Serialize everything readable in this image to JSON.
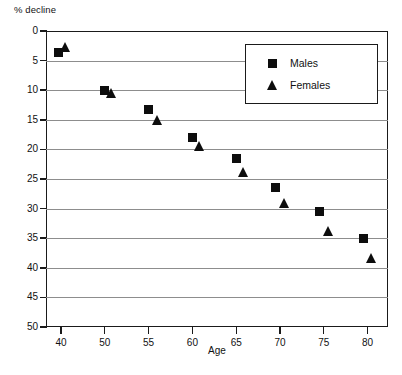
{
  "chart_data": {
    "type": "scatter",
    "title": "",
    "ylabel": "% decline",
    "xlabel": "Age",
    "ylim": [
      0,
      50
    ],
    "y_inverted": true,
    "grid": true,
    "legend_position": "top-right",
    "y_ticks": [
      "0",
      "5",
      "10",
      "15",
      "20",
      "25",
      "30",
      "35",
      "40",
      "45",
      "50"
    ],
    "x_ticks": [
      "40",
      "50",
      "55",
      "60",
      "65",
      "70",
      "75",
      "80"
    ],
    "series": [
      {
        "name": "Males",
        "marker": "square",
        "color": "#0d0d0d",
        "x": [
          39.5,
          50,
          55,
          60,
          65,
          69.5,
          74.5,
          79.5
        ],
        "values": [
          3.7,
          10.0,
          13.3,
          18.0,
          21.5,
          26.5,
          30.5,
          35.0
        ]
      },
      {
        "name": "Females",
        "marker": "triangle",
        "color": "#0d0d0d",
        "x": [
          41,
          50.8,
          56,
          60.8,
          65.8,
          70.5,
          75.5,
          80.5
        ],
        "values": [
          2.7,
          10.5,
          15.1,
          19.4,
          23.8,
          29.0,
          33.7,
          38.4
        ]
      }
    ]
  },
  "axes": {
    "y_title": "% decline",
    "x_title": "Age"
  },
  "legend": {
    "entries": [
      {
        "label": "Males",
        "marker": "square"
      },
      {
        "label": "Females",
        "marker": "triangle"
      }
    ]
  }
}
